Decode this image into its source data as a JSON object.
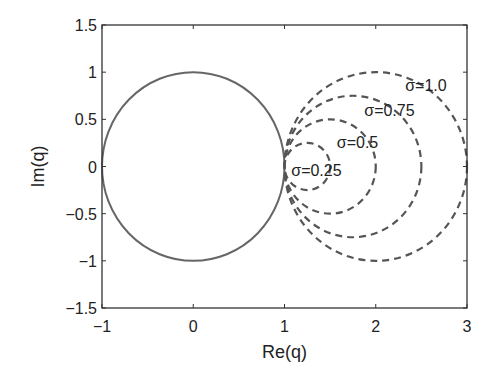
{
  "chart_data": {
    "type": "line",
    "title": "",
    "xlabel": "Re(q)",
    "ylabel": "Im(q)",
    "xlim": [
      -1,
      3
    ],
    "ylim": [
      -1.5,
      1.5
    ],
    "xticks": [
      -1,
      0,
      1,
      2,
      3
    ],
    "xtick_labels": [
      "−1",
      "0",
      "1",
      "2",
      "3"
    ],
    "yticks": [
      1.5,
      1,
      0.5,
      0,
      -0.5,
      -1,
      -1.5
    ],
    "ytick_labels": [
      "1.5",
      "1",
      "0.5",
      "0",
      "−0.5",
      "−1",
      "−1.5"
    ],
    "grid": false,
    "series": [
      {
        "name": "unit circle",
        "kind": "circle",
        "center": [
          0,
          0
        ],
        "radius": 1,
        "style": "solid",
        "color": "#666666"
      },
      {
        "name": "σ=0.25",
        "kind": "circle",
        "center": [
          1.25,
          0
        ],
        "radius": 0.25,
        "style": "dashed",
        "color": "#555555"
      },
      {
        "name": "σ=0.5",
        "kind": "circle",
        "center": [
          1.5,
          0
        ],
        "radius": 0.5,
        "style": "dashed",
        "color": "#555555"
      },
      {
        "name": "σ=0.75",
        "kind": "circle",
        "center": [
          1.75,
          0
        ],
        "radius": 0.75,
        "style": "dashed",
        "color": "#555555"
      },
      {
        "name": "σ=1.0",
        "kind": "circle",
        "center": [
          2,
          0
        ],
        "radius": 1.0,
        "style": "dashed",
        "color": "#555555"
      }
    ],
    "annotations": [
      {
        "text": "σ=1.0",
        "x": 2.55,
        "y": 0.86
      },
      {
        "text": "σ=0.75",
        "x": 2.15,
        "y": 0.6
      },
      {
        "text": "σ=0.5",
        "x": 1.8,
        "y": 0.26
      },
      {
        "text": "σ=0.25",
        "x": 1.35,
        "y": -0.04
      }
    ]
  }
}
